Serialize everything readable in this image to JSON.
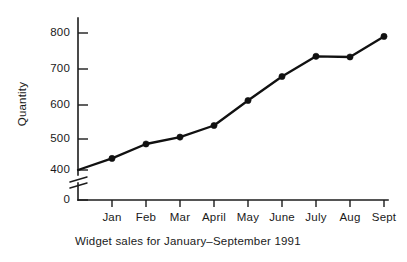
{
  "chart_data": {
    "type": "line",
    "title": "",
    "caption": "Widget sales for January–September 1991",
    "xlabel": "",
    "ylabel": "Quantity",
    "categories": [
      "Jan",
      "Feb",
      "Mar",
      "April",
      "May",
      "June",
      "July",
      "Aug",
      "Sept"
    ],
    "series": [
      {
        "name": "Widget sales",
        "values": [
          434,
          476,
          496,
          530,
          603,
          673,
          732,
          730,
          790
        ]
      }
    ],
    "origin_value": 400,
    "ytick_labels": [
      "800",
      "700",
      "600",
      "500",
      "400",
      "0"
    ],
    "ytick_values": [
      800,
      700,
      600,
      500,
      400,
      0
    ],
    "ylim": [
      400,
      830
    ],
    "axis_break": true,
    "axis_break_note": "y-axis broken between 0 and 400",
    "grid": false,
    "legend": "none",
    "marker": "filled-circle",
    "line_color": "#111111",
    "axis_color": "#1c1c1c",
    "background_color": "#ffffff"
  },
  "figure": {
    "ylabel": "Quantity",
    "caption": "Widget sales for January–September 1991",
    "y_labels": {
      "t800": "800",
      "t700": "700",
      "t600": "600",
      "t500": "500",
      "t400": "400",
      "t0": "0"
    },
    "x_labels": {
      "m1": "Jan",
      "m2": "Feb",
      "m3": "Mar",
      "m4": "April",
      "m5": "May",
      "m6": "June",
      "m7": "July",
      "m8": "Aug",
      "m9": "Sept"
    }
  }
}
